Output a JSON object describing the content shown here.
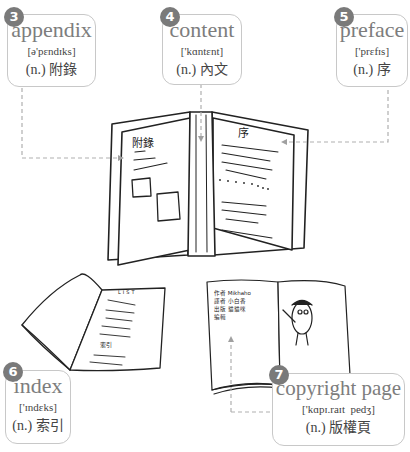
{
  "terms": [
    {
      "number": "3",
      "word": "appendix",
      "ipa": "[ə'pɛndɪks]",
      "pos": "(n.)",
      "translation": "附錄"
    },
    {
      "number": "4",
      "word": "content",
      "ipa": "['kɑntɛnt]",
      "pos": "(n.)",
      "translation": "內文"
    },
    {
      "number": "5",
      "word": "preface",
      "ipa": "['prɛfɪs]",
      "pos": "(n.)",
      "translation": "序"
    },
    {
      "number": "6",
      "word": "index",
      "ipa": "['ɪndɛks]",
      "pos": "(n.)",
      "translation": "索引"
    },
    {
      "number": "7",
      "word": "copyright page",
      "ipa": "['kɑpɪ.raɪt  pedʒ]",
      "pos": "(n.)",
      "translation": "版權頁"
    }
  ],
  "illustrations": {
    "open_book": {
      "left_page_heading": "附錄",
      "right_page_heading": "序"
    },
    "index_book": {
      "page_heading": "LIST",
      "section_label": "索引"
    },
    "copyright_book": {
      "lines": [
        "作者  Mikhaho",
        "譯者  小白香",
        "出版  貓貓咪",
        "編輯"
      ]
    }
  },
  "colors": {
    "badge": "#7a7a7a",
    "card_border": "#c8c8c8",
    "word": "#7d7d7d",
    "leader": "#b0b0b0"
  }
}
